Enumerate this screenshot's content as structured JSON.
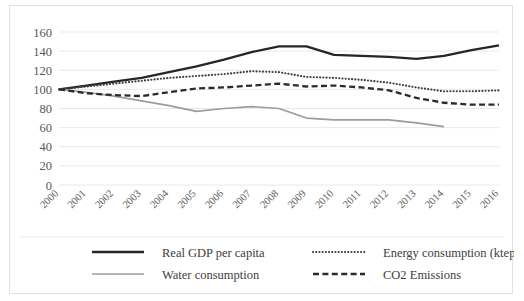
{
  "chart_data": {
    "type": "line",
    "title": "",
    "xlabel": "",
    "ylabel": "",
    "ylim": [
      0,
      160
    ],
    "ytick_step": 20,
    "yticks": [
      "160",
      "140",
      "120",
      "100",
      "80",
      "60",
      "40",
      "20",
      "0"
    ],
    "grid": true,
    "legend_position": "bottom",
    "x": [
      "2000",
      "2001",
      "2002",
      "2003",
      "2004",
      "2005",
      "2006",
      "2007",
      "2008",
      "2009",
      "2010",
      "2011",
      "2012",
      "2013",
      "2014",
      "2015",
      "2016"
    ],
    "series": [
      {
        "name": "Real GDP per capita",
        "color": "#262626",
        "style": "solid",
        "values": [
          100,
          104,
          108,
          112,
          118,
          124,
          131,
          139,
          145,
          145,
          136,
          135,
          134,
          132,
          135,
          141,
          146
        ]
      },
      {
        "name": "Energy consumption (ktep)",
        "color": "#3f3f3f",
        "style": "dotted",
        "values": [
          100,
          103,
          106,
          109,
          112,
          114,
          116,
          119,
          118,
          113,
          112,
          110,
          107,
          102,
          98,
          98,
          99
        ]
      },
      {
        "name": "Water consumption",
        "color": "#9c9c9c",
        "style": "solid-light",
        "values": [
          100,
          97,
          93,
          88,
          83,
          77,
          80,
          82,
          80,
          70,
          68,
          68,
          68,
          65,
          61,
          null,
          null
        ]
      },
      {
        "name": "CO2 Emissions",
        "color": "#2b2b2b",
        "style": "dashed",
        "values": [
          100,
          96,
          94,
          93,
          97,
          101,
          102,
          104,
          106,
          103,
          104,
          102,
          99,
          91,
          86,
          84,
          84
        ]
      }
    ]
  },
  "legend": {
    "items": [
      {
        "label": "Real GDP per capita",
        "swatch": "solid-thick-dark"
      },
      {
        "label": "Energy consumption (ktep)",
        "swatch": "dotted-dark"
      },
      {
        "label": "Water consumption",
        "swatch": "solid-gray"
      },
      {
        "label": "CO2 Emissions",
        "swatch": "dashed-dark"
      }
    ]
  }
}
